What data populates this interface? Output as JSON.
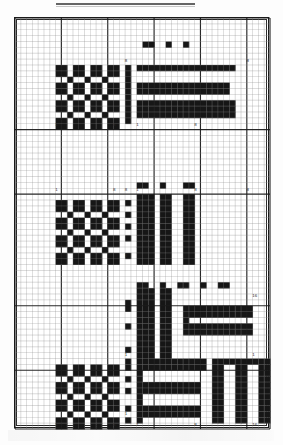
{
  "figure": {
    "title_rule": {
      "visible": true,
      "x": 55,
      "y": 3,
      "width": 140
    },
    "frame": {
      "x": 14,
      "y": 17,
      "width": 255,
      "height": 411
    },
    "grid": {
      "cols": 44,
      "rows": 70,
      "cell_w": 5.78,
      "cell_h": 5.86,
      "minor_color": "#8d8d8d",
      "major_color": "#1d1d1d",
      "major_col_every": [
        0,
        8,
        16,
        24,
        32,
        40,
        44
      ],
      "major_row_every": [
        0,
        19,
        30,
        49,
        60,
        70
      ]
    },
    "axis": {
      "tick_labels_bottom": [
        "1",
        "8",
        "1",
        "8"
      ],
      "tick_labels_rows": [
        {
          "row_y": 126,
          "labels": [
            "1",
            "8",
            "1",
            "8"
          ]
        },
        {
          "row_y": 240,
          "labels": [
            "1",
            "8",
            "1",
            "8"
          ]
        },
        {
          "row_y": 425,
          "labels": [
            "1",
            "8",
            "1",
            "16"
          ]
        }
      ],
      "corner_labels": [
        "16",
        "16",
        "1",
        "8"
      ],
      "max_index": "16",
      "min_index": "1"
    },
    "header_digits": {
      "staircase": [
        "0",
        "0",
        "0",
        "0",
        "0",
        "0",
        "0",
        "0",
        "0"
      ],
      "vertical_column": [
        "4",
        "3",
        "2",
        "1"
      ]
    },
    "cells_color": "#161616",
    "background_color": "#ffffff"
  },
  "chart_data": {
    "type": "heatmap",
    "title": "",
    "xlabel": "",
    "ylabel": "",
    "legend": [],
    "blocks": [
      {
        "name": "top-left-checkerboard",
        "col": 7,
        "row": 8,
        "w": 11,
        "h": 11
      },
      {
        "name": "top-right-bars",
        "col": 19,
        "row": 4,
        "w": 22,
        "h": 15
      },
      {
        "name": "mid-left-checkerboard",
        "col": 7,
        "row": 31,
        "w": 11,
        "h": 11
      },
      {
        "name": "mid-right-vertical-bars",
        "col": 19,
        "row": 28,
        "w": 22,
        "h": 14
      },
      {
        "name": "low-mid-vertical-bars",
        "col": 19,
        "row": 48,
        "w": 22,
        "h": 13
      },
      {
        "name": "bottom-left-checkerboard",
        "col": 7,
        "row": 58,
        "w": 11,
        "h": 11
      },
      {
        "name": "bottom-right-bars",
        "col": 19,
        "row": 58,
        "w": 24,
        "h": 12
      }
    ]
  }
}
